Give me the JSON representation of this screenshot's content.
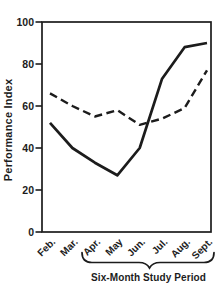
{
  "chart_data": {
    "type": "line",
    "title": "",
    "ylabel": "Performance Index",
    "xlabel": "Six-Month Study Period",
    "categories": [
      "Feb.",
      "Mar.",
      "Apr.",
      "May",
      "Jun.",
      "Jul.",
      "Aug.",
      "Sept."
    ],
    "series": [
      {
        "name": "solid",
        "style": "solid",
        "values": [
          52,
          40,
          33,
          27,
          40,
          73,
          88,
          90
        ]
      },
      {
        "name": "dashed",
        "style": "dashed",
        "values": [
          66,
          60,
          55,
          58,
          51,
          54,
          59,
          77
        ]
      }
    ],
    "ylim": [
      0,
      100
    ],
    "y_ticks": [
      0,
      20,
      40,
      60,
      80,
      100
    ],
    "grid": "off",
    "legend": "none",
    "brace": {
      "label": "Six-Month Study Period",
      "span_from": "Apr.",
      "span_to": "Sept."
    },
    "line_color": "#1c1c1c",
    "background": "#ffffff"
  }
}
